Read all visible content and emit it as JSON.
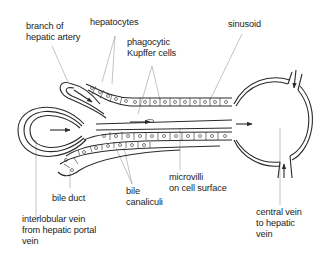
{
  "diagram": {
    "colors": {
      "line": "#2a2a2a",
      "leader": "#9a9a9a",
      "text": "#222222",
      "background": "#ffffff"
    },
    "labels": {
      "branch_hepatic_artery": "branch of\nhepatic artery",
      "hepatocytes": "hepatocytes",
      "kupffer": "phagocytic\nKupffer cells",
      "sinusoid": "sinusoid",
      "bile_duct": "bile duct",
      "bile_canaliculi": "bile\ncanaliculi",
      "microvilli": "microvilli\non cell surface",
      "interlobular_vein": "interlobular vein\nfrom hepatic portal\nvein",
      "central_vein": "central vein\nto hepatic\nvein"
    }
  }
}
